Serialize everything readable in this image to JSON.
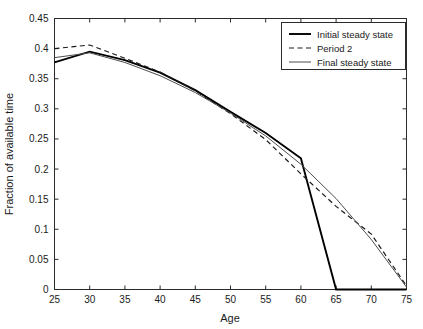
{
  "chart_data": {
    "type": "line",
    "title": "",
    "xlabel": "Age",
    "ylabel": "Fraction of available time",
    "xlim": [
      25,
      75
    ],
    "ylim": [
      0,
      0.45
    ],
    "xticks": [
      25,
      30,
      35,
      40,
      45,
      50,
      55,
      60,
      65,
      70,
      75
    ],
    "xtick_labels": [
      "25",
      "30",
      "35",
      "40",
      "45",
      "50",
      "55",
      "60",
      "65",
      "70",
      "75"
    ],
    "yticks": [
      0,
      0.05,
      0.1,
      0.15,
      0.2,
      0.25,
      0.3,
      0.35,
      0.4,
      0.45
    ],
    "ytick_labels": [
      "0",
      "0.05",
      "0.1",
      "0.15",
      "0.2",
      "0.25",
      "0.3",
      "0.35",
      "0.4",
      "0.45"
    ],
    "grid": false,
    "legend_position": "top-right",
    "x": [
      25,
      30,
      35,
      40,
      45,
      50,
      55,
      60,
      65,
      70,
      75
    ],
    "series": [
      {
        "name": "Initial steady state",
        "style": "solid",
        "color": "#000000",
        "width": 1.9,
        "values": [
          0.377,
          0.395,
          0.381,
          0.36,
          0.331,
          0.295,
          0.26,
          0.218,
          0.0,
          0.0,
          0.0
        ]
      },
      {
        "name": "Period 2",
        "style": "dashed",
        "color": "#1a1a1a",
        "width": 1.2,
        "values": [
          0.4,
          0.406,
          0.384,
          0.361,
          0.33,
          0.292,
          0.249,
          0.192,
          0.138,
          0.092,
          0.006
        ]
      },
      {
        "name": "Final steady state",
        "style": "solid",
        "color": "#4d4d4d",
        "width": 1.0,
        "values": [
          0.385,
          0.393,
          0.377,
          0.355,
          0.327,
          0.293,
          0.255,
          0.208,
          0.151,
          0.083,
          0.004
        ]
      }
    ]
  },
  "legend": {
    "entries": [
      {
        "label": "Initial steady state"
      },
      {
        "label": "Period 2"
      },
      {
        "label": "Final steady state"
      }
    ]
  },
  "axes": {
    "x_title": "Age",
    "y_title": "Fraction of available time"
  }
}
